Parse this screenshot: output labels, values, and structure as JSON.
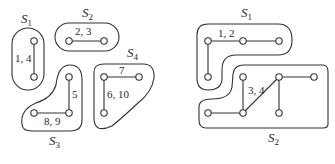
{
  "figure": {
    "left_panel": {
      "sets": [
        {
          "name": "S",
          "sub": "1",
          "edge_label": "1, 4"
        },
        {
          "name": "S",
          "sub": "2",
          "edge_label": "2, 3"
        },
        {
          "name": "S",
          "sub": "3",
          "edge_labels": [
            "5",
            "8, 9"
          ]
        },
        {
          "name": "S",
          "sub": "4",
          "edge_labels": [
            "7",
            "6, 10"
          ]
        }
      ]
    },
    "right_panel": {
      "sets": [
        {
          "name": "S",
          "sub": "1",
          "edge_label": "1, 2"
        },
        {
          "name": "S",
          "sub": "2",
          "edge_label": "3, 4"
        }
      ]
    }
  }
}
